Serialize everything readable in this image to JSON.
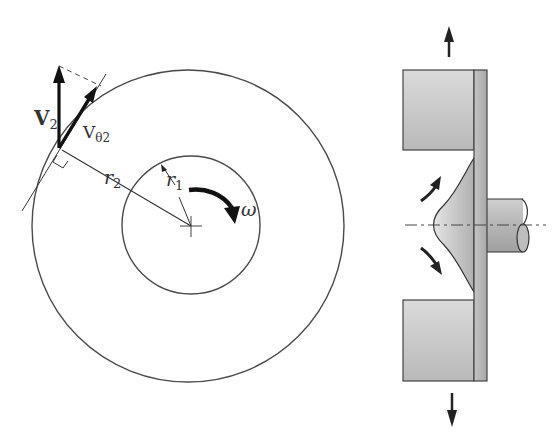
{
  "figure": {
    "left_panel": {
      "description": "Rotating disk with inner and outer radius, velocity triangle at outer edge",
      "labels": {
        "v2": "V",
        "v2_sub": "2",
        "vtheta": "V",
        "vtheta_sub": "θ2",
        "r2": "r",
        "r2_sub": "2",
        "r1": "r",
        "r1_sub": "1",
        "omega": "ω"
      }
    },
    "right_panel": {
      "description": "Cross-section of a rotating disk pump / fluid film between stationary blocks with shaft"
    },
    "colors": {
      "line": "#3a3a3a",
      "fill_gray": "#c8c8c8",
      "fill_light": "#dcdcdc",
      "arrow": "#222222"
    }
  }
}
